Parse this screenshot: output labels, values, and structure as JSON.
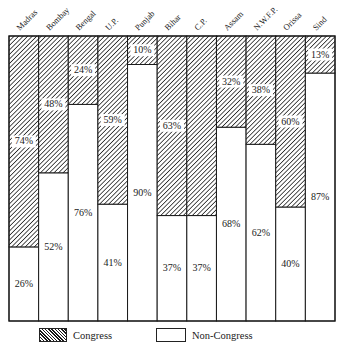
{
  "chart_data": {
    "type": "bar",
    "stacked": true,
    "normalized": true,
    "title": "",
    "xlabel": "",
    "ylabel": "",
    "ylim": [
      0,
      100
    ],
    "grid": false,
    "categories": [
      "Madras",
      "Bombay",
      "Bengal",
      "U.P.",
      "Punjab",
      "Bihar",
      "C.P.",
      "Assam",
      "N.W.F.P.",
      "Orissa",
      "Sind"
    ],
    "series": [
      {
        "name": "Non-Congress",
        "pattern": "blank",
        "values": [
          26,
          52,
          76,
          41,
          90,
          37,
          37,
          68,
          62,
          40,
          87
        ],
        "labels": [
          "26%",
          "52%",
          "76%",
          "41%",
          "90%",
          "37%",
          "37%",
          "68%",
          "62%",
          "40%",
          "87%"
        ]
      },
      {
        "name": "Congress",
        "pattern": "hatched",
        "values": [
          74,
          48,
          24,
          59,
          10,
          63,
          63,
          32,
          38,
          60,
          13
        ],
        "labels": [
          "74%",
          "48%",
          "24%",
          "59%",
          "10%",
          "63%",
          "",
          "32%",
          "38%",
          "60%",
          "13%"
        ]
      }
    ],
    "legend": {
      "placement": "bottom",
      "entries": [
        {
          "name": "Congress",
          "pattern": "hatched"
        },
        {
          "name": "Non-Congress",
          "pattern": "blank"
        }
      ]
    },
    "colors": {
      "ink": "#1a1a1a",
      "background": "#ffffff"
    }
  }
}
